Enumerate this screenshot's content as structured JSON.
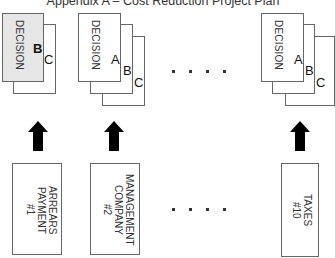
{
  "title": "Appendix A – Cost Reduction Project Plan",
  "decision_stacks": [
    {
      "label": "DECISION",
      "front_letter": "B",
      "back_letters": [
        "C"
      ]
    },
    {
      "label": "DECISION",
      "front_letter": "A",
      "back_letters": [
        "B",
        "C"
      ]
    },
    {
      "label": "DECISION",
      "front_letter": "A",
      "back_letters": [
        "B",
        "C"
      ]
    }
  ],
  "ellipsis": "....",
  "projects": [
    {
      "line1": "ARREARS",
      "line2": "PAYMENT",
      "line3": "#1"
    },
    {
      "line1": "MANAGEMENT",
      "line2": "COMPANY",
      "line3": "#2"
    },
    {
      "line1": "TAXES",
      "line2": "#10",
      "line3": ""
    }
  ],
  "colors": {
    "front_box_fill_1": "#e6e6e6",
    "border": "#666666",
    "arrow": "#000000"
  }
}
